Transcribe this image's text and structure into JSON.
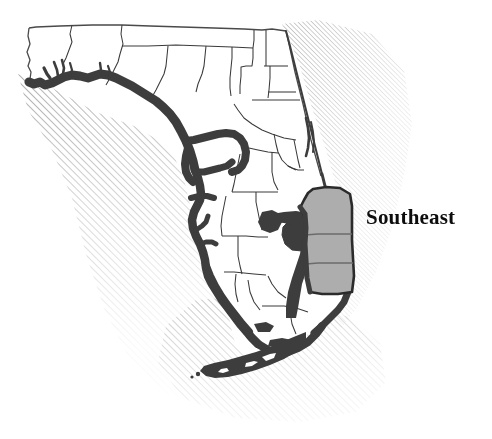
{
  "figure": {
    "type": "thematic-region-map",
    "background_color": "#ffffff",
    "width": 492,
    "height": 439
  },
  "labels": {
    "region_label": "Southeast"
  },
  "colors": {
    "background": "#ffffff",
    "land_fill": "#ffffff",
    "county_outline": "#3a3a3a",
    "state_outline": "#4a4a4a",
    "coast_heavy": "#3d3d3d",
    "highlight_fill": "#adadad",
    "highlight_outline": "#2b2b2b",
    "hatch_line": "#6e6e6e",
    "label_text": "#0d0d0d"
  },
  "map_features": {
    "state_outline_name": "florida-state-outline",
    "gulf_coast_name": "gulf-coast-heavy-line",
    "atlantic_coast_name": "atlantic-coast-line",
    "keys_name": "florida-keys",
    "lake_name": "lake-okeechobee",
    "ocean_hatching_name": "ocean-hatching",
    "highlighted_region_name": "southeast-region",
    "highlighted_county_count": 3,
    "county_divider_count": 2
  },
  "legend": {
    "shaded_meaning": "Southeast"
  }
}
